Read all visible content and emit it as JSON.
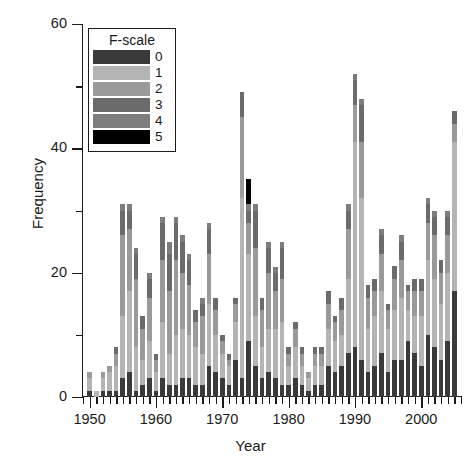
{
  "chart_data": {
    "type": "bar",
    "stacked": true,
    "title": "",
    "xlabel": "Year",
    "ylabel": "Frequency",
    "xlim": [
      1949,
      2006
    ],
    "ylim": [
      0,
      60
    ],
    "ytick_major": [
      0,
      20,
      40,
      60
    ],
    "ytick_minor": [
      10,
      30,
      50
    ],
    "xtick_major": [
      1950,
      1960,
      1970,
      1980,
      1990,
      2000
    ],
    "xtick_minor_step": 1,
    "grid": false,
    "legend": {
      "title": "F-scale",
      "position": "upper-left-inset",
      "entries": [
        {
          "label": "0",
          "color": "#3a3a3a"
        },
        {
          "label": "1",
          "color": "#b4b4b4"
        },
        {
          "label": "2",
          "color": "#9a9a9a"
        },
        {
          "label": "3",
          "color": "#6b6b6b"
        },
        {
          "label": "4",
          "color": "#7d7d7d"
        },
        {
          "label": "5",
          "color": "#000000"
        }
      ]
    },
    "categories": [
      1950,
      1951,
      1952,
      1953,
      1954,
      1955,
      1956,
      1957,
      1958,
      1959,
      1960,
      1961,
      1962,
      1963,
      1964,
      1965,
      1966,
      1967,
      1968,
      1969,
      1970,
      1971,
      1972,
      1973,
      1974,
      1975,
      1976,
      1977,
      1978,
      1979,
      1980,
      1981,
      1982,
      1983,
      1984,
      1985,
      1986,
      1987,
      1988,
      1989,
      1990,
      1991,
      1992,
      1993,
      1994,
      1995,
      1996,
      1997,
      1998,
      1999,
      2000,
      2001,
      2002,
      2003,
      2004,
      2005
    ],
    "series": [
      {
        "name": "0",
        "color": "#3a3a3a",
        "values": [
          1,
          0,
          1,
          1,
          1,
          3,
          4,
          1,
          2,
          3,
          1,
          3,
          2,
          2,
          3,
          3,
          2,
          2,
          5,
          4,
          3,
          2,
          6,
          3,
          9,
          5,
          3,
          4,
          3,
          2,
          2,
          3,
          2,
          1,
          2,
          2,
          5,
          4,
          5,
          7,
          8,
          6,
          4,
          5,
          7,
          4,
          6,
          6,
          9,
          7,
          5,
          10,
          8,
          6,
          9,
          17
        ]
      },
      {
        "name": "1",
        "color": "#b4b4b4",
        "values": [
          2,
          1,
          2,
          3,
          4,
          10,
          13,
          7,
          4,
          6,
          3,
          9,
          5,
          8,
          8,
          7,
          6,
          5,
          10,
          6,
          4,
          3,
          6,
          29,
          14,
          8,
          5,
          7,
          8,
          10,
          3,
          5,
          3,
          2,
          3,
          3,
          6,
          5,
          5,
          12,
          33,
          26,
          7,
          8,
          10,
          7,
          8,
          10,
          5,
          6,
          8,
          12,
          11,
          9,
          11,
          24
        ]
      },
      {
        "name": "2",
        "color": "#9a9a9a",
        "values": [
          1,
          0,
          1,
          1,
          2,
          13,
          10,
          11,
          5,
          7,
          2,
          10,
          10,
          12,
          9,
          8,
          4,
          6,
          8,
          4,
          2,
          1,
          3,
          13,
          5,
          11,
          6,
          9,
          6,
          7,
          2,
          3,
          2,
          1,
          2,
          2,
          4,
          3,
          4,
          8,
          6,
          9,
          5,
          4,
          6,
          3,
          5,
          6,
          3,
          4,
          4,
          6,
          7,
          5,
          6,
          3
        ]
      },
      {
        "name": "3",
        "color": "#6b6b6b",
        "values": [
          0,
          0,
          0,
          0,
          1,
          4,
          3,
          4,
          2,
          3,
          1,
          6,
          6,
          6,
          5,
          4,
          2,
          2,
          4,
          2,
          1,
          1,
          1,
          4,
          2,
          6,
          2,
          4,
          3,
          5,
          1,
          1,
          1,
          0,
          1,
          1,
          2,
          1,
          2,
          3,
          4,
          6,
          2,
          2,
          3,
          1,
          2,
          3,
          1,
          2,
          2,
          3,
          3,
          2,
          3,
          2
        ]
      },
      {
        "name": "4",
        "color": "#7d7d7d",
        "values": [
          0,
          0,
          0,
          0,
          0,
          1,
          1,
          1,
          0,
          1,
          0,
          1,
          2,
          1,
          1,
          1,
          0,
          1,
          1,
          0,
          0,
          0,
          0,
          0,
          1,
          1,
          0,
          1,
          1,
          1,
          0,
          0,
          0,
          0,
          0,
          0,
          0,
          0,
          0,
          1,
          1,
          1,
          0,
          0,
          1,
          0,
          0,
          1,
          0,
          0,
          0,
          1,
          1,
          0,
          1,
          0
        ]
      },
      {
        "name": "5",
        "color": "#000000",
        "values": [
          0,
          0,
          0,
          0,
          0,
          0,
          0,
          0,
          0,
          0,
          0,
          0,
          0,
          0,
          0,
          0,
          0,
          0,
          0,
          0,
          0,
          0,
          0,
          0,
          4,
          0,
          0,
          0,
          0,
          0,
          0,
          0,
          0,
          0,
          0,
          0,
          0,
          0,
          0,
          0,
          0,
          0,
          0,
          0,
          0,
          0,
          0,
          0,
          0,
          0,
          0,
          0,
          0,
          0,
          0,
          0
        ]
      }
    ]
  }
}
